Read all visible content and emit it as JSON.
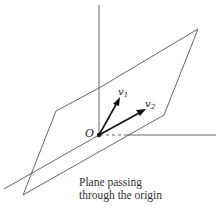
{
  "figure": {
    "origin_label": "O",
    "vectors": [
      {
        "name": "v1",
        "label_main": "v",
        "label_sub": "1"
      },
      {
        "name": "v2",
        "label_main": "v",
        "label_sub": "2"
      }
    ],
    "caption": {
      "line1": "Plane passing",
      "line2": "through the origin"
    },
    "colors": {
      "line": "#555555",
      "vector": "#111111",
      "background": "#ffffff"
    }
  }
}
